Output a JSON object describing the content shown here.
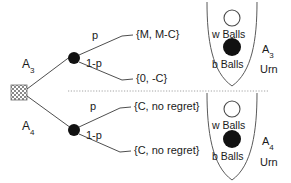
{
  "figure": {
    "type": "decision-tree-with-urns",
    "background": "#ffffff",
    "ink": "#1a1a1a"
  },
  "tree": {
    "root": {
      "name": "root-node",
      "shape": "hatched-square"
    },
    "branches": [
      {
        "action_label": "A",
        "action_sub": "3",
        "chance_node": "filled-circle",
        "outcomes": [
          {
            "prob": "p",
            "payoff": "{M, M-C}"
          },
          {
            "prob": "1-p",
            "payoff": "{0, -C}"
          }
        ]
      },
      {
        "action_label": "A",
        "action_sub": "4",
        "chance_node": "filled-circle",
        "outcomes": [
          {
            "prob": "p",
            "payoff": "{C, no regret}"
          },
          {
            "prob": "1-p",
            "payoff": "{C, no regret}"
          }
        ]
      }
    ],
    "divider": "dotted-horizontal-separator"
  },
  "urns": [
    {
      "name": "A",
      "name_sub": "3",
      "word": "Urn",
      "white_ball_label": "w Balls",
      "black_ball_label": "b Balls",
      "white_ball_fill": "#ffffff",
      "black_ball_fill": "#111111"
    },
    {
      "name": "A",
      "name_sub": "4",
      "word": "Urn",
      "white_ball_label": "w Balls",
      "black_ball_label": "b Balls",
      "white_ball_fill": "#ffffff",
      "black_ball_fill": "#111111"
    }
  ]
}
